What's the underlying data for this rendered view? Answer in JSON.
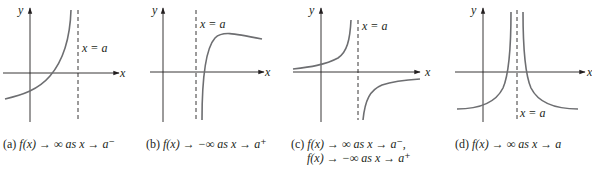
{
  "panels": [
    {
      "id": "a",
      "axis_x_label": "x",
      "axis_y_label": "y",
      "asymptote_label": "x = a",
      "caption_prefix": "(a)",
      "caption_lines": [
        "f(x) → ∞ as x → a⁻"
      ],
      "description": "f increases without bound as x approaches a from the left"
    },
    {
      "id": "b",
      "axis_x_label": "x",
      "axis_y_label": "y",
      "asymptote_label": "x = a",
      "caption_prefix": "(b)",
      "caption_lines": [
        "f(x) → −∞ as x → a⁺"
      ],
      "description": "f decreases without bound as x approaches a from the right"
    },
    {
      "id": "c",
      "axis_x_label": "x",
      "axis_y_label": "y",
      "asymptote_label": "x = a",
      "caption_prefix": "(c)",
      "caption_lines": [
        "f(x) → ∞ as x → a⁻,",
        "f(x) → −∞ as x → a⁺"
      ],
      "description": "f goes to +∞ from the left and −∞ from the right"
    },
    {
      "id": "d",
      "axis_x_label": "x",
      "axis_y_label": "y",
      "asymptote_label": "x = a",
      "caption_prefix": "(d)",
      "caption_lines": [
        "f(x) → ∞ as x → a"
      ],
      "description": "f goes to +∞ from both sides of a"
    }
  ],
  "colors": {
    "axis": "#231f20",
    "curve": "#6d6e71",
    "asymptote": "#231f20",
    "text": "#231f20"
  }
}
